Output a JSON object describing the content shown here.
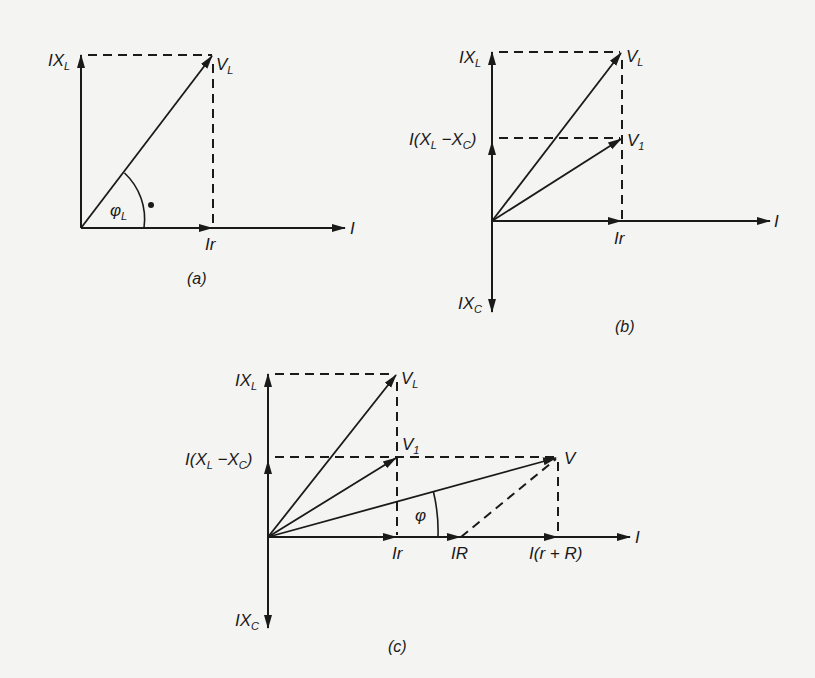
{
  "figure": {
    "diagrams": [
      {
        "id": "a",
        "caption": "(a)",
        "labels": {
          "vertical_axis": "IX",
          "vertical_axis_sub": "L",
          "resultant": "V",
          "resultant_sub": "L",
          "horizontal_axis": "I",
          "resistive_drop": "Ir",
          "angle": "φ",
          "angle_sub": "L"
        }
      },
      {
        "id": "b",
        "caption": "(b)",
        "labels": {
          "vertical_axis": "IX",
          "vertical_axis_sub": "L",
          "net_reactive": "I(X",
          "net_reactive_sub1": "L",
          "net_reactive_mid": " −X",
          "net_reactive_sub2": "C",
          "net_reactive_end": ")",
          "resultant_L": "V",
          "resultant_L_sub": "L",
          "resultant_1": "V",
          "resultant_1_sub": "1",
          "horizontal_axis": "I",
          "resistive_drop": "Ir",
          "capacitive": "IX",
          "capacitive_sub": "C"
        }
      },
      {
        "id": "c",
        "caption": "(c)",
        "labels": {
          "vertical_axis": "IX",
          "vertical_axis_sub": "L",
          "net_reactive": "I(X",
          "net_reactive_sub1": "L",
          "net_reactive_mid": " −X",
          "net_reactive_sub2": "C",
          "net_reactive_end": ")",
          "resultant_L": "V",
          "resultant_L_sub": "L",
          "resultant_1": "V",
          "resultant_1_sub": "1",
          "resultant_total": "V",
          "horizontal_axis": "I",
          "coil_drop": "Ir",
          "resistor_drop": "IR",
          "total_drop": "I(r + R)",
          "angle": "φ",
          "capacitive": "IX",
          "capacitive_sub": "C"
        }
      }
    ]
  },
  "colors": {
    "background": "#f4f4f2",
    "ink": "#1a1a1a"
  }
}
